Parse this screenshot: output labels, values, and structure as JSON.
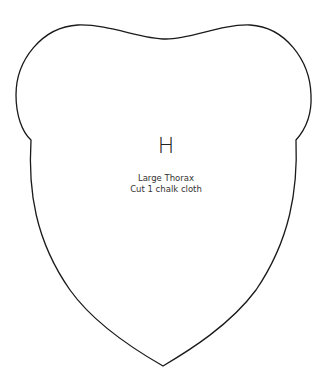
{
  "pattern_piece": {
    "letter": "H",
    "name": "Large Thorax",
    "instruction": "Cut 1 chalk cloth",
    "outline_color": "#1a1a1a",
    "background": "#ffffff"
  }
}
